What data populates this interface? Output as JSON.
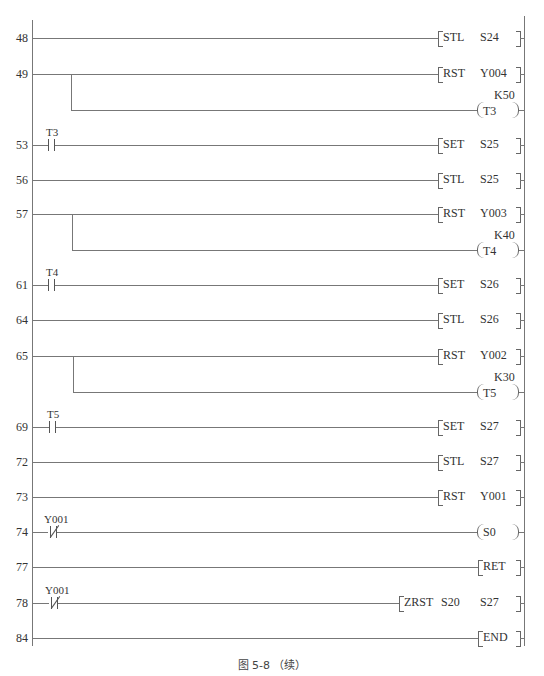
{
  "figure": {
    "caption": "图 5-8 （续）"
  },
  "rungs": [
    {
      "step": "48",
      "contact": null,
      "instruction": "STL",
      "operand1": "S24",
      "operand2": null,
      "type": "bracket"
    },
    {
      "step": "49",
      "contact": null,
      "instruction": "RST",
      "operand1": "Y004",
      "operand2": null,
      "type": "bracket"
    },
    {
      "step": null,
      "contact": null,
      "instruction": "T3",
      "operand1": "K50",
      "operand2": null,
      "type": "coil",
      "branch_of": "49"
    },
    {
      "step": "53",
      "contact": {
        "label": "T3",
        "kind": "NO"
      },
      "instruction": "SET",
      "operand1": "S25",
      "operand2": null,
      "type": "bracket"
    },
    {
      "step": "56",
      "contact": null,
      "instruction": "STL",
      "operand1": "S25",
      "operand2": null,
      "type": "bracket"
    },
    {
      "step": "57",
      "contact": null,
      "instruction": "RST",
      "operand1": "Y003",
      "operand2": null,
      "type": "bracket"
    },
    {
      "step": null,
      "contact": null,
      "instruction": "T4",
      "operand1": "K40",
      "operand2": null,
      "type": "coil",
      "branch_of": "57"
    },
    {
      "step": "61",
      "contact": {
        "label": "T4",
        "kind": "NO"
      },
      "instruction": "SET",
      "operand1": "S26",
      "operand2": null,
      "type": "bracket"
    },
    {
      "step": "64",
      "contact": null,
      "instruction": "STL",
      "operand1": "S26",
      "operand2": null,
      "type": "bracket"
    },
    {
      "step": "65",
      "contact": null,
      "instruction": "RST",
      "operand1": "Y002",
      "operand2": null,
      "type": "bracket"
    },
    {
      "step": null,
      "contact": null,
      "instruction": "T5",
      "operand1": "K30",
      "operand2": null,
      "type": "coil",
      "branch_of": "65"
    },
    {
      "step": "69",
      "contact": {
        "label": "T5",
        "kind": "NO"
      },
      "instruction": "SET",
      "operand1": "S27",
      "operand2": null,
      "type": "bracket"
    },
    {
      "step": "72",
      "contact": null,
      "instruction": "STL",
      "operand1": "S27",
      "operand2": null,
      "type": "bracket"
    },
    {
      "step": "73",
      "contact": null,
      "instruction": "RST",
      "operand1": "Y001",
      "operand2": null,
      "type": "bracket"
    },
    {
      "step": "74",
      "contact": {
        "label": "Y001",
        "kind": "NC"
      },
      "instruction": "S0",
      "operand1": null,
      "operand2": null,
      "type": "coil"
    },
    {
      "step": "77",
      "contact": null,
      "instruction": "RET",
      "operand1": null,
      "operand2": null,
      "type": "bracket"
    },
    {
      "step": "78",
      "contact": {
        "label": "Y001",
        "kind": "NC"
      },
      "instruction": "ZRST",
      "operand1": "S20",
      "operand2": "S27",
      "type": "bracket"
    },
    {
      "step": "84",
      "contact": null,
      "instruction": "END",
      "operand1": null,
      "operand2": null,
      "type": "bracket"
    }
  ]
}
